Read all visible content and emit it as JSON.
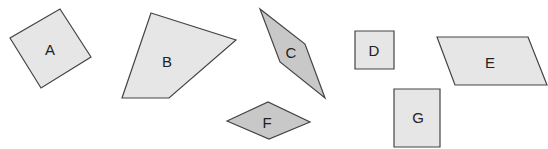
{
  "diagram": {
    "title": "",
    "colors": {
      "stroke": "#444444",
      "fill_light": "#e6e6e6",
      "fill_dark": "#c8c8c8",
      "label": "#222222",
      "background": "#ffffff"
    },
    "shapes": [
      {
        "id": "A",
        "label": "A",
        "kind": "square-rotated",
        "fill": "light",
        "points": "60,9 91,57 41,88 10,38",
        "label_pos": [
          50,
          49
        ]
      },
      {
        "id": "B",
        "label": "B",
        "kind": "quadrilateral",
        "fill": "light",
        "points": "151,13 236,40 169,98 122,98",
        "label_pos": [
          167,
          61
        ]
      },
      {
        "id": "C",
        "label": "C",
        "kind": "rhombus",
        "fill": "dark",
        "points": "260,9 305,44 325,98 280,62",
        "label_pos": [
          291,
          52
        ]
      },
      {
        "id": "D",
        "label": "D",
        "kind": "square",
        "fill": "light",
        "points": "355,31 394,31 394,69 355,69",
        "label_pos": [
          374,
          50
        ]
      },
      {
        "id": "E",
        "label": "E",
        "kind": "parallelogram",
        "fill": "light",
        "points": "437,37 528,37 547,85 455,85",
        "label_pos": [
          490,
          62
        ]
      },
      {
        "id": "F",
        "label": "F",
        "kind": "rhombus",
        "fill": "dark",
        "points": "227,121 268,102 310,122 269,139",
        "label_pos": [
          267,
          122
        ]
      },
      {
        "id": "G",
        "label": "G",
        "kind": "rectangle",
        "fill": "light",
        "points": "394,89 440,89 440,147 394,147",
        "label_pos": [
          418,
          117
        ]
      }
    ]
  }
}
